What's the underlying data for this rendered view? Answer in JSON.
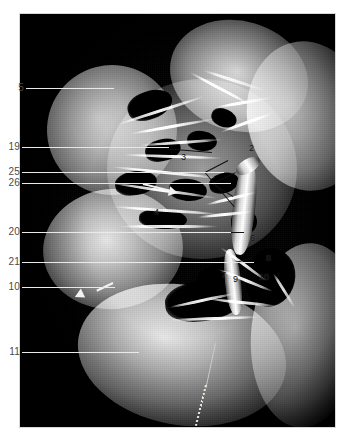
{
  "figure": {
    "kind": "anatomical-dissection-photograph",
    "orientation": "sagittal-section",
    "background_color": "#000000",
    "page_background": "#ffffff",
    "caption_text": ""
  },
  "plate": {
    "left_labels": [
      {
        "id": "label-5",
        "text": "5",
        "x": 8,
        "y": 83,
        "leader_to_x": 95,
        "leader_y": 88
      },
      {
        "id": "label-19",
        "text": "19",
        "x": 4,
        "y": 142,
        "leader_to_x": 150,
        "leader_y": 147
      },
      {
        "id": "label-25",
        "text": "25",
        "x": 4,
        "y": 167,
        "leader_to_x": 205,
        "leader_y": 172
      },
      {
        "id": "label-26",
        "text": "26",
        "x": 4,
        "y": 178,
        "leader_to_x": 212,
        "leader_y": 183
      },
      {
        "id": "label-20",
        "text": "20",
        "x": 4,
        "y": 227,
        "leader_to_x": 212,
        "leader_y": 232
      },
      {
        "id": "label-21",
        "text": "21",
        "x": 4,
        "y": 257,
        "leader_to_x": 235,
        "leader_y": 262
      },
      {
        "id": "label-10",
        "text": "10",
        "x": 4,
        "y": 282,
        "leader_to_x": 96,
        "leader_y": 287
      },
      {
        "id": "label-11",
        "text": "11",
        "x": 4,
        "y": 347,
        "leader_to_x": 120,
        "leader_y": 352
      }
    ],
    "inner_numbers": [
      {
        "id": "inner-2",
        "text": "2",
        "x": 249,
        "y": 144
      },
      {
        "id": "inner-3",
        "text": "3",
        "x": 181,
        "y": 153
      },
      {
        "id": "inner-4",
        "text": "4",
        "x": 154,
        "y": 208
      },
      {
        "id": "inner-6",
        "text": "6",
        "x": 250,
        "y": 234
      },
      {
        "id": "inner-8",
        "text": "8",
        "x": 266,
        "y": 254
      },
      {
        "id": "inner-7",
        "text": "7",
        "x": 221,
        "y": 271
      },
      {
        "id": "inner-9",
        "text": "9",
        "x": 233,
        "y": 275
      },
      {
        "id": "inner-10",
        "text": "10",
        "x": 259,
        "y": 273
      }
    ],
    "arrows": [
      {
        "id": "arrow-mid",
        "from_x": 143,
        "from_y": 183,
        "to_x": 176,
        "to_y": 191,
        "color": "#f2f2f2"
      },
      {
        "id": "arrow-lower",
        "from_x": 113,
        "from_y": 282,
        "to_x": 90,
        "to_y": 293,
        "color": "#f2f2f2"
      }
    ]
  },
  "colors": {
    "photo_background": "#000000",
    "label_text": "#4a4a4a",
    "leader_light": "#e9e9e9",
    "leader_dark": "#1d1d1d",
    "arrow": "#f2f2f2",
    "tissue_highlight": "#e6e2db",
    "tissue_mid": "#8a857e",
    "tissue_shadow": "#13120f"
  }
}
